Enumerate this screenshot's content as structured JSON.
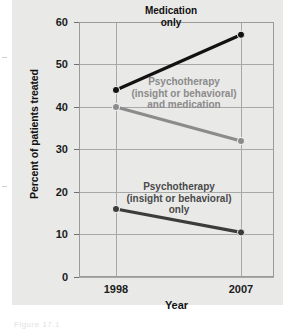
{
  "figure": {
    "caption_remnant": "Figure 17.1"
  },
  "chart_data": {
    "type": "line",
    "title": "",
    "subtitle": "",
    "xlabel": "Year",
    "ylabel": "Percent of patients treated",
    "categories": [
      "1998",
      "2007"
    ],
    "x": [
      1998,
      2007
    ],
    "xlim": [
      1998,
      2007
    ],
    "ylim": [
      0,
      60
    ],
    "yticks": [
      0,
      10,
      20,
      30,
      40,
      50,
      60
    ],
    "ytick_labels": [
      "0",
      "10",
      "20",
      "30",
      "40",
      "50",
      "60"
    ],
    "xtick_labels": [
      "1998",
      "2007"
    ],
    "grid": true,
    "grid_axis": "both",
    "legend": "inline-annotations",
    "legend_position": "inside-plot",
    "series": [
      {
        "name": "Medication only",
        "label": "Medication\nonly",
        "label_line1": "Medication",
        "label_line2": "only",
        "color": "#121212",
        "marker_color": "#121212",
        "values": [
          44,
          57
        ]
      },
      {
        "name": "Psychotherapy (insight or behavioral) and medication",
        "label_line1": "Psychotherapy",
        "label_line2": "(insight or behavioral)",
        "label_line3": "and medication",
        "color": "#8b8b8b",
        "marker_color": "#8b8b8b",
        "values": [
          40,
          32
        ]
      },
      {
        "name": "Psychotherapy (insight or behavioral) only",
        "label_line1": "Psychotherapy",
        "label_line2": "(insight or behavioral)",
        "label_line3": "only",
        "color": "#3c3c3c",
        "marker_color": "#3c3c3c",
        "values": [
          16,
          10.5
        ]
      }
    ]
  },
  "colors": {
    "panel_background": "#e9e9e8",
    "page_background": "#ffffff",
    "grid": "#a8a8a8",
    "frame": "#9a9a9a",
    "text": "#1b1b1b"
  }
}
